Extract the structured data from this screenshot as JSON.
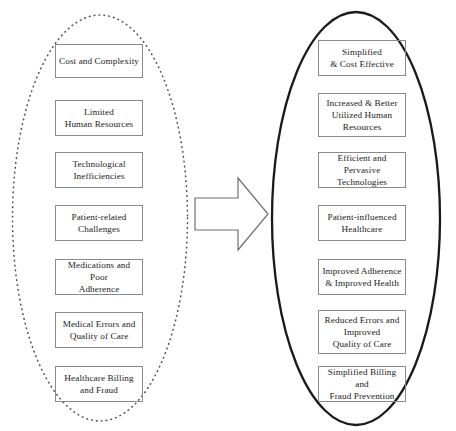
{
  "diagram": {
    "type": "before-after-transformation",
    "arrow": {
      "name": "transformation-arrow",
      "direction": "right",
      "label": ""
    },
    "left_group": {
      "label": "",
      "shape": "ellipse",
      "border_style": "dotted",
      "border_color": "#555555",
      "items": [
        {
          "id": "cost-and-complexity",
          "text": "Cost and Complexity"
        },
        {
          "id": "limited-human-resources",
          "text": "Limited\nHuman Resources"
        },
        {
          "id": "technological-inefficiencies",
          "text": "Technological\nInefficiencies"
        },
        {
          "id": "patient-related-challenges",
          "text": "Patient-related\nChallenges"
        },
        {
          "id": "medications-and-poor-adherence",
          "text": "Medications and Poor\nAdherence"
        },
        {
          "id": "medical-errors-and-quality-of-care",
          "text": "Medical Errors and\nQuality of Care"
        },
        {
          "id": "healthcare-billing-and-fraud",
          "text": "Healthcare Billing\nand Fraud"
        }
      ]
    },
    "right_group": {
      "label": "",
      "shape": "ellipse",
      "border_style": "solid",
      "border_color": "#1a1a1a",
      "items": [
        {
          "id": "simplified-and-cost-effective",
          "text": "Simplified\n& Cost Effective"
        },
        {
          "id": "increased-and-better-utilized-human-resources",
          "text": "Increased & Better\nUtilized Human\nResources"
        },
        {
          "id": "efficient-and-pervasive-technologies",
          "text": "Efficient and\nPervasive Technologies"
        },
        {
          "id": "patient-influenced-healthcare",
          "text": "Patient-influenced\nHealthcare"
        },
        {
          "id": "improved-adherence-and-improved-health",
          "text": "Improved Adherence\n& Improved Health"
        },
        {
          "id": "reduced-errors-and-improved-quality-of-care",
          "text": "Reduced Errors and\nImproved\nQuality of Care"
        },
        {
          "id": "simplified-billing-and-fraud-prevention",
          "text": "Simplified Billing and\nFraud Prevention"
        }
      ]
    }
  },
  "colors": {
    "box_border": "#8a8a8a",
    "text": "#1c1c1c",
    "ellipse_dotted": "#555555",
    "ellipse_solid": "#1a1a1a",
    "arrow_outline": "#6e6e6e",
    "background": "#ffffff"
  }
}
